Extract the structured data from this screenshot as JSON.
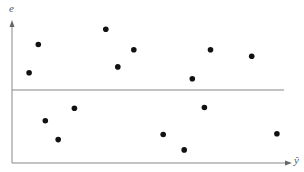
{
  "chart_data": {
    "type": "scatter",
    "title": "",
    "xlabel": "ŷ",
    "ylabel": "e",
    "grid": false,
    "legend": null,
    "reference_line": {
      "y": 0,
      "label": ""
    },
    "xlim": [
      0,
      100
    ],
    "ylim": [
      -1,
      1
    ],
    "points": [
      {
        "x": 6.1,
        "y": 0.26
      },
      {
        "x": 9.4,
        "y": 0.69
      },
      {
        "x": 11.9,
        "y": -0.42
      },
      {
        "x": 16.5,
        "y": -0.68
      },
      {
        "x": 22.3,
        "y": -0.25
      },
      {
        "x": 33.5,
        "y": 0.92
      },
      {
        "x": 37.8,
        "y": 0.35
      },
      {
        "x": 43.5,
        "y": 0.61
      },
      {
        "x": 54.0,
        "y": -0.61
      },
      {
        "x": 61.5,
        "y": -0.82
      },
      {
        "x": 64.4,
        "y": 0.17
      },
      {
        "x": 68.7,
        "y": -0.24
      },
      {
        "x": 70.9,
        "y": 0.61
      },
      {
        "x": 85.6,
        "y": 0.51
      },
      {
        "x": 94.6,
        "y": -0.6
      }
    ],
    "point_color": "#111111",
    "axis_color": "#888888"
  },
  "labels": {
    "y_axis": "e",
    "x_axis": "ŷ"
  }
}
